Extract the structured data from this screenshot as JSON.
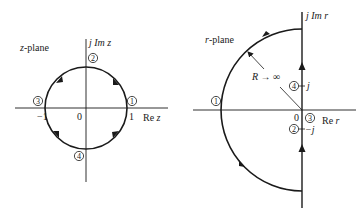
{
  "z_plane": {
    "title": "z-plane",
    "imag_axis_label": "j Im z",
    "real_axis_label": "Re z",
    "ticks": {
      "neg_one": "−1",
      "origin": "0",
      "one": "1"
    },
    "points": [
      {
        "id": "1",
        "label": "1",
        "location": "z = 1"
      },
      {
        "id": "2",
        "label": "2",
        "location": "z = j"
      },
      {
        "id": "3",
        "label": "3",
        "location": "z = -1"
      },
      {
        "id": "4",
        "label": "4",
        "location": "z = -j"
      }
    ],
    "contour": "unit circle, clockwise"
  },
  "r_plane": {
    "title": "r-plane",
    "imag_axis_label": "j Im r",
    "real_axis_label": "Re r",
    "radius_label": "R → ∞",
    "ticks": {
      "origin": "0",
      "j": "j",
      "neg_j": "−j"
    },
    "points": [
      {
        "id": "1",
        "label": "1",
        "location": "left on real axis at infinity"
      },
      {
        "id": "2",
        "label": "2",
        "location": "r = -j"
      },
      {
        "id": "3",
        "label": "3",
        "location": "r = 0"
      },
      {
        "id": "4",
        "label": "4",
        "location": "r = j"
      }
    ],
    "contour": "imaginary axis upward plus left half-circle of infinite radius"
  }
}
